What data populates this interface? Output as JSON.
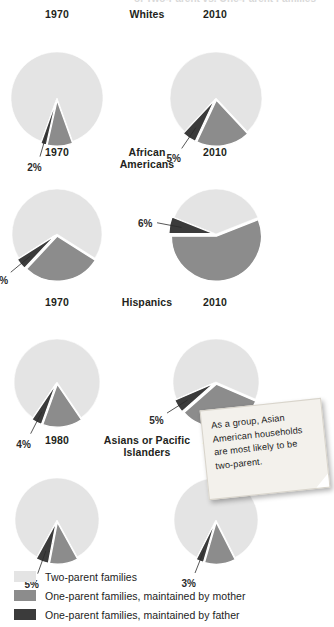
{
  "chart_data": {
    "type": "pie",
    "title": "",
    "legend_position": "bottom-left",
    "legend": [
      {
        "label": "Two-parent families",
        "color": "#e4e4e4",
        "key": "two_parent"
      },
      {
        "label": "One-parent families, maintained by mother",
        "color": "#8c8c8c",
        "key": "mother"
      },
      {
        "label": "One-parent families, maintained by father",
        "color": "#3b3b3b",
        "key": "father"
      }
    ],
    "categories": [
      "Two-parent families",
      "One-parent families, maintained by mother",
      "One-parent families, maintained by father"
    ],
    "groups": [
      {
        "name": "Whites",
        "title_lines": [
          "Whites"
        ],
        "charts": [
          {
            "year": "1970",
            "values": [
              89,
              9,
              2
            ],
            "labels": [
              "89%",
              "9%",
              "2%"
            ]
          },
          {
            "year": "2010",
            "values": [
              76,
              19,
              5
            ],
            "labels": [
              "76%",
              "19%",
              "5%"
            ]
          }
        ]
      },
      {
        "name": "African Americans",
        "title_lines": [
          "African",
          "Americans"
        ],
        "charts": [
          {
            "year": "1970",
            "values": [
              68,
              28,
              4
            ],
            "labels": [
              "68%",
              "28%",
              "4%"
            ]
          },
          {
            "year": "2010",
            "values": [
              38,
              56,
              6
            ],
            "labels": [
              "38%",
              "56%",
              "6%"
            ]
          }
        ]
      },
      {
        "name": "Hispanics",
        "title_lines": [
          "Hispanics"
        ],
        "charts": [
          {
            "year": "1970",
            "values": [
              81,
              15,
              4
            ],
            "labels": [
              "81%",
              "15%",
              "4%"
            ]
          },
          {
            "year": "2010",
            "values": [
              63,
              32,
              5
            ],
            "labels": [
              "63%",
              "32%",
              "5%"
            ]
          }
        ]
      },
      {
        "name": "Asians or Pacific Islanders",
        "title_lines": [
          "Asians or Pacific",
          "Islanders"
        ],
        "charts": [
          {
            "year": "1980",
            "values": [
              84,
              11,
              5
            ],
            "labels": [
              "84%",
              "11%",
              "5%"
            ]
          },
          {
            "year": "2010",
            "values": [
              85,
              12,
              3
            ],
            "labels": [
              "85%",
              "12%",
              "3%"
            ]
          }
        ]
      }
    ]
  },
  "callout": {
    "text": "As a group, Asian American households are most likely to be two-parent."
  },
  "top_cut_text": "of Two-Parent vs. One-Parent Families"
}
